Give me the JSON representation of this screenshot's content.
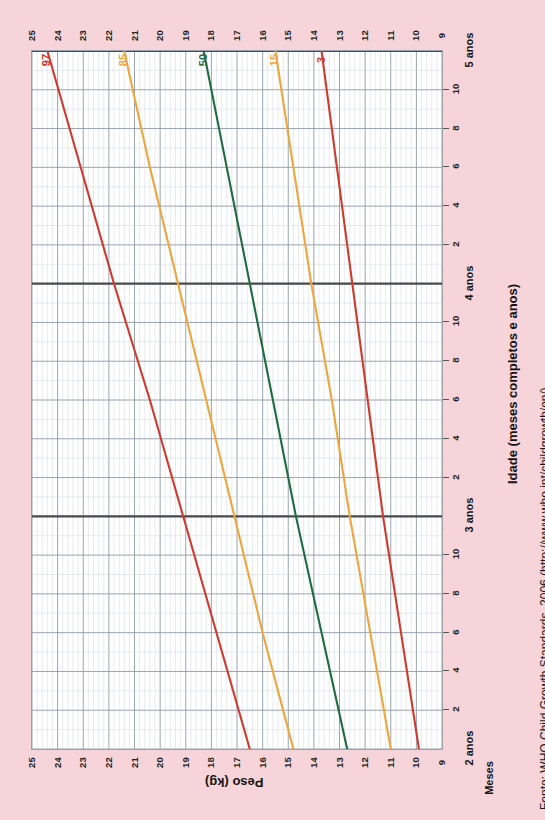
{
  "chart_data": {
    "type": "line",
    "title": "",
    "orientation": "rotated-90",
    "xlabel": "Peso (kg)",
    "ylabel": "Idade (meses completos e anos)",
    "months_label": "Meses",
    "weight_axis": {
      "label": "Peso (kg)",
      "unit": "kg",
      "ticks": [
        25,
        24,
        23,
        22,
        21,
        20,
        19,
        18,
        17,
        16,
        15,
        14,
        13,
        12,
        11,
        10,
        9
      ],
      "range": [
        9,
        25
      ],
      "direction": "decreasing-left-to-right"
    },
    "age_axis": {
      "label": "Idade (meses completos e anos)",
      "year_labels": [
        "5 anos",
        "4 anos",
        "3 anos",
        "2 anos"
      ],
      "month_ticks": [
        10,
        8,
        6,
        4,
        2
      ],
      "range_months": [
        24,
        60
      ],
      "direction": "decreasing-top-to-bottom"
    },
    "grid": true,
    "legend": "inline-endpoint-labels",
    "series": [
      {
        "name": "97",
        "label": "97",
        "color": "#cf3a2e",
        "age_months": [
          60,
          54,
          48,
          42,
          36,
          30,
          24
        ],
        "weight_kg": [
          24.4,
          23.1,
          21.8,
          20.4,
          19.1,
          17.8,
          16.5
        ]
      },
      {
        "name": "85",
        "label": "85",
        "color": "#eda63b",
        "age_months": [
          60,
          54,
          48,
          42,
          36,
          30,
          24
        ],
        "weight_kg": [
          21.4,
          20.4,
          19.3,
          18.2,
          17.1,
          16.0,
          14.8
        ]
      },
      {
        "name": "50",
        "label": "50",
        "color": "#1f6b42",
        "age_months": [
          60,
          54,
          48,
          42,
          36,
          30,
          24
        ],
        "weight_kg": [
          18.3,
          17.4,
          16.5,
          15.6,
          14.7,
          13.7,
          12.7
        ]
      },
      {
        "name": "15",
        "label": "15",
        "color": "#eda63b",
        "age_months": [
          60,
          54,
          48,
          42,
          36,
          30,
          24
        ],
        "weight_kg": [
          15.5,
          14.8,
          14.1,
          13.3,
          12.6,
          11.8,
          11.0
        ]
      },
      {
        "name": "3",
        "label": "3",
        "color": "#cf3a2e",
        "age_months": [
          60,
          54,
          48,
          42,
          36,
          30,
          24
        ],
        "weight_kg": [
          13.7,
          13.1,
          12.5,
          11.9,
          11.3,
          10.6,
          9.9
        ]
      }
    ]
  },
  "labels": {
    "peso_title": "Peso (kg)",
    "idade_title": "Idade (meses completos e anos)",
    "meses": "Meses",
    "fonte": "Fonte: WHO Child Growth Standards, 2006 (http://www.who.int/childgrowth/en/)"
  },
  "colors": {
    "background": "#f6d4d9",
    "plot_background": "#ffffff",
    "grid_major": "#8f9aa8",
    "grid_minor": "#c9d2dc",
    "year_line": "#4a4a4a",
    "red": "#cf3a2e",
    "orange": "#eda63b",
    "green": "#1f6b42",
    "text": "#231f20"
  }
}
